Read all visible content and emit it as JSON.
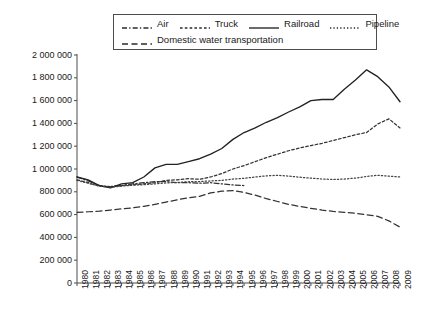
{
  "chart_data": {
    "type": "line",
    "title": "",
    "subtitle": "",
    "xlabel": "",
    "ylabel": "",
    "grid": false,
    "legend_position": "top",
    "xlim": [
      1980,
      2009
    ],
    "ylim": [
      0,
      2000000
    ],
    "ytick_labels": [
      "2 000 000",
      "1 800 000",
      "1 600 000",
      "1 400 000",
      "1 200 000",
      "1 000 000",
      "800 000",
      "600 000",
      "400 000",
      "200 000",
      "0"
    ],
    "ytick_values": [
      2000000,
      1800000,
      1600000,
      1400000,
      1200000,
      1000000,
      800000,
      600000,
      400000,
      200000,
      0
    ],
    "categories": [
      1980,
      1981,
      1982,
      1983,
      1984,
      1985,
      1986,
      1987,
      1988,
      1989,
      1990,
      1991,
      1992,
      1993,
      1994,
      1995,
      1996,
      1997,
      1998,
      1999,
      2000,
      2001,
      2002,
      2003,
      2004,
      2005,
      2006,
      2007,
      2008,
      2009
    ],
    "xtick_labels": [
      "1980",
      "1981",
      "1982",
      "1983",
      "1984",
      "1985",
      "1986",
      "1987",
      "1988",
      "1989",
      "1990",
      "1991",
      "1992",
      "1993",
      "1994",
      "1995",
      "1996",
      "1997",
      "1998",
      "1999",
      "2000",
      "2001",
      "2002",
      "2003",
      "2004",
      "2005",
      "2006",
      "2007",
      "2008",
      "2009"
    ],
    "series": [
      {
        "name": "Air",
        "style": "dashdot",
        "color": "#333333",
        "values": [
          930000,
          895000,
          855000,
          845000,
          855000,
          870000,
          880000,
          890000,
          890000,
          880000,
          880000,
          875000,
          880000,
          870000,
          860000,
          855000,
          null,
          null,
          null,
          null,
          null,
          null,
          null,
          null,
          null,
          null,
          null,
          null,
          null,
          null
        ]
      },
      {
        "name": "Truck",
        "style": "dotted-fine",
        "color": "#333333",
        "values": [
          905000,
          880000,
          850000,
          845000,
          855000,
          862000,
          870000,
          880000,
          900000,
          905000,
          915000,
          910000,
          930000,
          960000,
          1000000,
          1030000,
          1065000,
          1100000,
          1130000,
          1160000,
          1185000,
          1205000,
          1225000,
          1250000,
          1275000,
          1300000,
          1320000,
          1395000,
          1440000,
          1360000
        ]
      },
      {
        "name": "Railroad",
        "style": "solid",
        "color": "#222222",
        "values": [
          930000,
          905000,
          855000,
          835000,
          870000,
          880000,
          930000,
          1010000,
          1040000,
          1040000,
          1065000,
          1090000,
          1130000,
          1180000,
          1260000,
          1320000,
          1360000,
          1410000,
          1450000,
          1500000,
          1545000,
          1600000,
          1610000,
          1610000,
          1700000,
          1780000,
          1870000,
          1810000,
          1720000,
          1590000
        ]
      },
      {
        "name": "Pipeline",
        "style": "dotted",
        "color": "#444444",
        "values": [
          900000,
          875000,
          850000,
          840000,
          850000,
          858000,
          862000,
          870000,
          878000,
          882000,
          888000,
          890000,
          895000,
          900000,
          912000,
          918000,
          930000,
          940000,
          945000,
          938000,
          928000,
          920000,
          912000,
          908000,
          912000,
          920000,
          935000,
          945000,
          938000,
          930000
        ]
      },
      {
        "name": "Domestic water transportation",
        "style": "dashed",
        "color": "#333333",
        "values": [
          620000,
          625000,
          630000,
          640000,
          650000,
          660000,
          672000,
          690000,
          710000,
          730000,
          748000,
          760000,
          790000,
          805000,
          810000,
          795000,
          770000,
          740000,
          715000,
          690000,
          672000,
          655000,
          640000,
          628000,
          620000,
          612000,
          598000,
          585000,
          545000,
          490000
        ]
      }
    ]
  },
  "legend": {
    "row1": [
      {
        "label": "Air",
        "style": "dashdot"
      },
      {
        "label": "Truck",
        "style": "dotted-fine"
      },
      {
        "label": "Railroad",
        "style": "solid"
      },
      {
        "label": "Pipeline",
        "style": "dotted"
      }
    ],
    "row2": [
      {
        "label": "Domestic water transportation",
        "style": "dashed"
      }
    ]
  }
}
